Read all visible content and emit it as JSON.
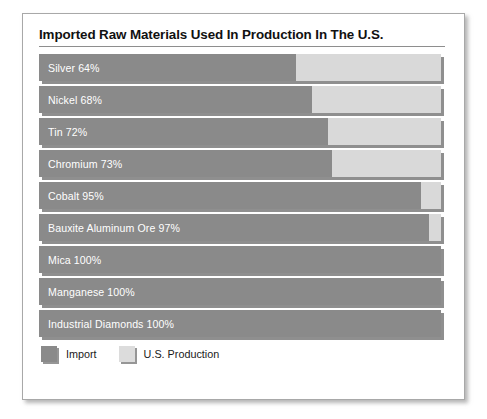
{
  "chart_data": {
    "type": "bar",
    "orientation": "horizontal",
    "stacked": true,
    "title": "Imported Raw Materials Used In Production In The U.S.",
    "xlabel": "",
    "ylabel": "",
    "xlim": [
      0,
      100
    ],
    "grid": false,
    "legend_position": "bottom-left",
    "value_unit": "%",
    "categories": [
      "Silver",
      "Nickel",
      "Tin",
      "Chromium",
      "Cobalt",
      "Bauxite Aluminum Ore",
      "Mica",
      "Manganese",
      "Industrial Diamonds"
    ],
    "series": [
      {
        "name": "Import",
        "color": "#8a8a8a",
        "values": [
          64,
          68,
          72,
          73,
          95,
          97,
          100,
          100,
          100
        ]
      },
      {
        "name": "U.S. Production",
        "color": "#d9d9d9",
        "values": [
          36,
          32,
          28,
          27,
          5,
          3,
          0,
          0,
          0
        ]
      }
    ],
    "bars": [
      {
        "label": "Silver 64%",
        "name": "Silver",
        "import_pct": 64,
        "us_pct": 36
      },
      {
        "label": "Nickel 68%",
        "name": "Nickel",
        "import_pct": 68,
        "us_pct": 32
      },
      {
        "label": "Tin 72%",
        "name": "Tin",
        "import_pct": 72,
        "us_pct": 28
      },
      {
        "label": "Chromium 73%",
        "name": "Chromium",
        "import_pct": 73,
        "us_pct": 27
      },
      {
        "label": "Cobalt 95%",
        "name": "Cobalt",
        "import_pct": 95,
        "us_pct": 5
      },
      {
        "label": "Bauxite Aluminum Ore 97%",
        "name": "Bauxite Aluminum Ore",
        "import_pct": 97,
        "us_pct": 3
      },
      {
        "label": "Mica 100%",
        "name": "Mica",
        "import_pct": 100,
        "us_pct": 0
      },
      {
        "label": "Manganese 100%",
        "name": "Manganese",
        "import_pct": 100,
        "us_pct": 0
      },
      {
        "label": "Industrial Diamonds 100%",
        "name": "Industrial Diamonds",
        "import_pct": 100,
        "us_pct": 0
      }
    ]
  },
  "legend": {
    "items": [
      {
        "label": "Import",
        "swatch": "import",
        "color": "#8a8a8a"
      },
      {
        "label": "U.S. Production",
        "swatch": "usprod",
        "color": "#d9d9d9"
      }
    ]
  },
  "colors": {
    "import": "#8a8a8a",
    "us_production": "#d9d9d9",
    "card_background": "#ffffff",
    "frame_border": "#a8a8a8",
    "title_text": "#111111",
    "bar_label_text": "#ffffff"
  }
}
